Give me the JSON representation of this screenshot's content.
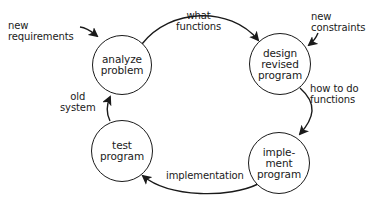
{
  "diagram": {
    "type": "cycle",
    "colors": {
      "ink": "#1a1a1a",
      "background": "#ffffff"
    },
    "nodes": [
      {
        "id": "analyze",
        "label": "analyze\nproblem",
        "cx": 122,
        "cy": 65,
        "r": 30
      },
      {
        "id": "design",
        "label": "design\nrevised\nprogram",
        "cx": 280,
        "cy": 64,
        "r": 31
      },
      {
        "id": "implement",
        "label": "imple-\nment\nprogram",
        "cx": 279,
        "cy": 163,
        "r": 31
      },
      {
        "id": "test",
        "label": "test\nprogram",
        "cx": 122,
        "cy": 151,
        "r": 31
      }
    ],
    "edges": [
      {
        "from": "analyze",
        "to": "design",
        "label": "what\nfunctions"
      },
      {
        "from": "design",
        "to": "implement",
        "label": "how to do\nfunctions"
      },
      {
        "from": "implement",
        "to": "test",
        "label": "implementation"
      },
      {
        "from": "test",
        "to": "analyze",
        "label": "old\nsystem"
      }
    ],
    "inputs": [
      {
        "to": "analyze",
        "label": "new\nrequirements"
      },
      {
        "to": "design",
        "label": "new\nconstraints"
      }
    ]
  }
}
